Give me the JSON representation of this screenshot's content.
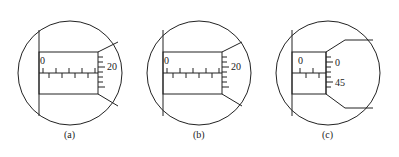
{
  "figure": {
    "panels": [
      {
        "id": "a",
        "caption": "(a)",
        "main_zero_label": "0",
        "thimble_label": "20"
      },
      {
        "id": "b",
        "caption": "(b)",
        "main_zero_label": "0",
        "thimble_label": "20"
      },
      {
        "id": "c",
        "caption": "(c)",
        "main_zero_label": "0",
        "thimble_label_top": "0",
        "thimble_label_bottom": "45"
      }
    ]
  }
}
